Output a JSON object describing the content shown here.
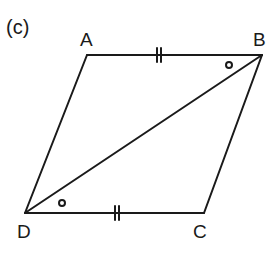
{
  "figure": {
    "panel_label": "(c)",
    "shape": "parallelogram",
    "vertices": {
      "A": {
        "label": "A",
        "x": 87,
        "y": 55
      },
      "B": {
        "label": "B",
        "x": 262,
        "y": 55
      },
      "C": {
        "label": "C",
        "x": 204,
        "y": 213
      },
      "D": {
        "label": "D",
        "x": 25,
        "y": 213
      }
    },
    "diagonal": [
      "D",
      "B"
    ],
    "equal_sides": [
      {
        "side": "AB",
        "ticks": 2
      },
      {
        "side": "DC",
        "ticks": 2
      }
    ],
    "equal_angles": [
      {
        "angle": "ABD",
        "mark": "circle"
      },
      {
        "angle": "BDC",
        "mark": "circle"
      }
    ],
    "colors": {
      "stroke": "#1a1a1a",
      "background": "#ffffff"
    }
  }
}
